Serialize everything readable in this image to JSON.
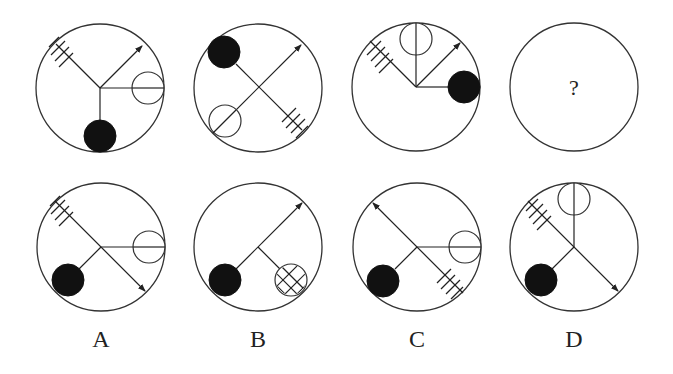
{
  "puzzle": {
    "question_row": [
      {
        "id": "panel-1",
        "elements": [
          "hatch-4-lines upper-left",
          "arrow upper-right",
          "open-circle right",
          "filled-circle bottom"
        ]
      },
      {
        "id": "panel-2",
        "elements": [
          "filled-circle upper-left",
          "arrow upper-right",
          "open-circle lower-left",
          "hatch-4-lines lower-right"
        ]
      },
      {
        "id": "panel-3",
        "elements": [
          "hatch-4-lines upper-left",
          "open-circle top",
          "arrow upper-right",
          "filled-circle right"
        ]
      },
      {
        "id": "panel-4",
        "placeholder": "?"
      }
    ],
    "options": [
      {
        "label": "A",
        "elements": [
          "hatch-4-lines upper-left",
          "open-circle right",
          "filled-circle lower-left",
          "arrow lower-right"
        ]
      },
      {
        "label": "B",
        "elements": [
          "arrow upper-right",
          "filled-circle lower-left",
          "hatched-circle lower-right"
        ]
      },
      {
        "label": "C",
        "elements": [
          "arrow upper-left",
          "open-circle right",
          "filled-circle lower-left",
          "hatch-4-lines lower-right"
        ]
      },
      {
        "label": "D",
        "elements": [
          "hatch-4-lines upper-left",
          "open-circle top",
          "filled-circle lower-left",
          "arrow lower-right"
        ]
      }
    ]
  }
}
